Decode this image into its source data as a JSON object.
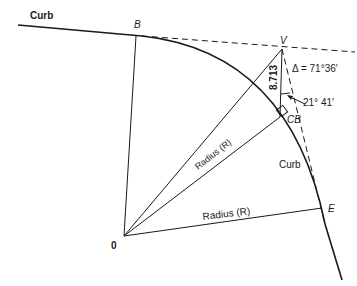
{
  "labels": {
    "curb_top": "Curb",
    "curb_right": "Curb",
    "point_b": "B",
    "point_v": "V",
    "point_e": "E",
    "point_cb": "CB",
    "center_o": "0",
    "radius_1": "Radius (R)",
    "radius_2": "Radius (R)",
    "delta": "Δ = 71°36′",
    "angle_small": "21° 41′",
    "distance": "8.713"
  },
  "colors": {
    "line": "#1a1a1a",
    "background": "#ffffff"
  }
}
